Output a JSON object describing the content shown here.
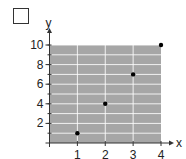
{
  "checkbox": {
    "checked": false
  },
  "chart_data": {
    "type": "scatter",
    "title": "",
    "xlabel": "x",
    "ylabel": "y",
    "x": [
      1,
      2,
      3,
      4
    ],
    "y": [
      1,
      4,
      7,
      10
    ],
    "xlim": [
      0,
      4
    ],
    "ylim": [
      0,
      10
    ],
    "xticks": [
      "1",
      "2",
      "3",
      "4"
    ],
    "yticks": [
      "2",
      "4",
      "6",
      "8",
      "10"
    ],
    "grid": true,
    "plot_background": "#a6a6a6",
    "grid_color": "#ffffff",
    "point_color": "#000000"
  }
}
